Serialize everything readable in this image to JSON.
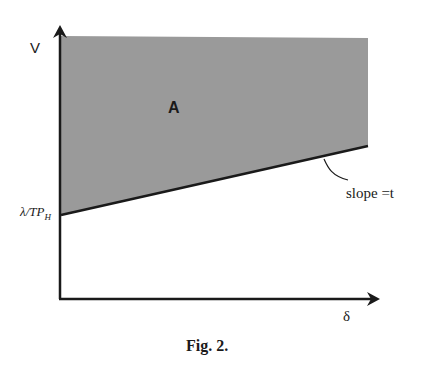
{
  "figure": {
    "caption": "Fig. 2.",
    "y_axis_label": "V",
    "x_axis_label": "δ",
    "region_label": "A",
    "intercept_label_main": "λ/TP",
    "intercept_label_sub": "H",
    "slope_label": "slope =t",
    "colors": {
      "region_fill": "#9a9a9a",
      "axis": "#1a1a1a",
      "boundary": "#1a1a1a",
      "background": "#ffffff"
    }
  }
}
